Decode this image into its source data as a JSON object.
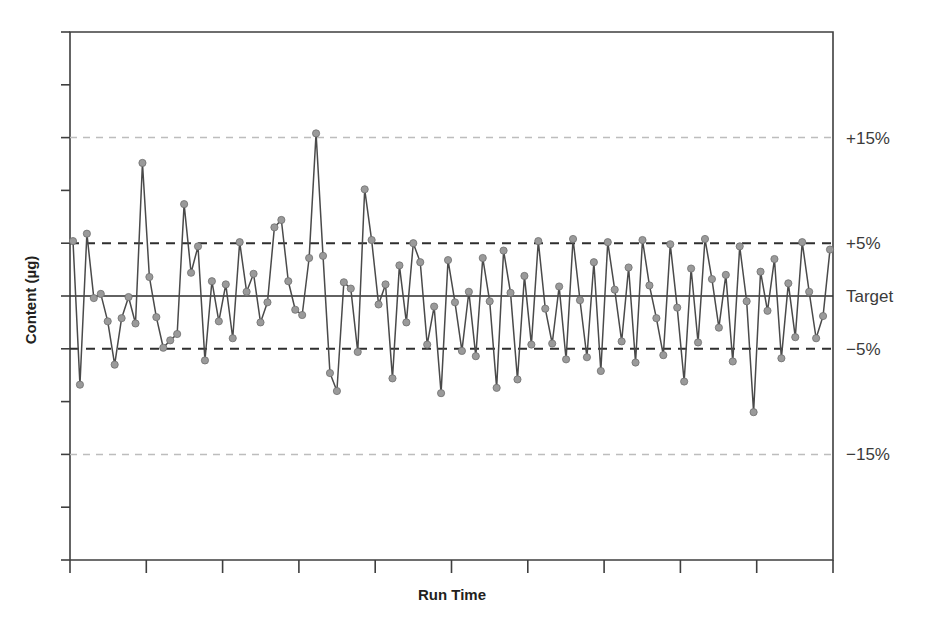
{
  "chart_data": {
    "type": "line",
    "title": "",
    "xlabel": "Run Time",
    "ylabel": "Content (µg)",
    "grid": false,
    "legend": "right-outside",
    "x_tick_labels": [],
    "y_tick_labels": [],
    "x_tick_count": 11,
    "y_tick_count": 11,
    "ylim": [
      -25,
      25
    ],
    "y_unit": "percent deviation from target",
    "reference_lines": [
      {
        "label": "+15%",
        "value": 15,
        "style": "dashed",
        "color": "#bdbdbd",
        "weight": "light"
      },
      {
        "label": "+5%",
        "value": 5,
        "style": "dashed",
        "color": "#2e2e2e",
        "weight": "bold"
      },
      {
        "label": "Target",
        "value": 0,
        "style": "solid",
        "color": "#2e2e2e",
        "weight": "normal"
      },
      {
        "label": "−5%",
        "value": -5,
        "style": "dashed",
        "color": "#2e2e2e",
        "weight": "bold"
      },
      {
        "label": "−15%",
        "value": -15,
        "style": "dashed",
        "color": "#bdbdbd",
        "weight": "light"
      }
    ],
    "series": [
      {
        "name": "Content",
        "marker": "circle",
        "marker_color": "#9a9a9a",
        "line_color": "#4a4a4a",
        "values": [
          5.2,
          -8.4,
          5.9,
          -0.2,
          0.2,
          -2.4,
          -6.5,
          -2.1,
          -0.1,
          -2.6,
          12.6,
          1.8,
          -2.0,
          -4.9,
          -4.2,
          -3.6,
          8.7,
          2.2,
          4.7,
          -6.1,
          1.4,
          -2.4,
          1.1,
          -4.0,
          5.1,
          0.4,
          2.1,
          -2.5,
          -0.6,
          6.5,
          7.2,
          1.4,
          -1.3,
          -1.8,
          3.6,
          15.4,
          3.8,
          -7.3,
          -9.0,
          1.3,
          0.7,
          -5.3,
          10.1,
          5.3,
          -0.8,
          1.1,
          -7.8,
          2.9,
          -2.5,
          5.0,
          3.2,
          -4.6,
          -1.0,
          -9.2,
          3.4,
          -0.6,
          -5.2,
          0.4,
          -5.7,
          3.6,
          -0.5,
          -8.7,
          4.3,
          0.3,
          -7.9,
          1.9,
          -4.6,
          5.2,
          -1.2,
          -4.5,
          0.9,
          -6.0,
          5.4,
          -0.4,
          -5.8,
          3.2,
          -7.1,
          5.1,
          0.6,
          -4.3,
          2.7,
          -6.3,
          5.3,
          1.0,
          -2.1,
          -5.6,
          4.9,
          -1.1,
          -8.1,
          2.6,
          -4.4,
          5.4,
          1.6,
          -3.0,
          2.0,
          -6.2,
          4.7,
          -0.5,
          -11.0,
          2.3,
          -1.4,
          3.5,
          -5.9,
          1.2,
          -3.9,
          5.1,
          0.4,
          -4.0,
          -1.9,
          4.4
        ]
      }
    ]
  },
  "axis": {
    "x_title": "Run Time",
    "y_title": "Content (µg)"
  },
  "labels": {
    "plus15": "+15%",
    "plus5": "+5%",
    "target": "Target",
    "minus5": "−5%",
    "minus15": "−15%"
  }
}
